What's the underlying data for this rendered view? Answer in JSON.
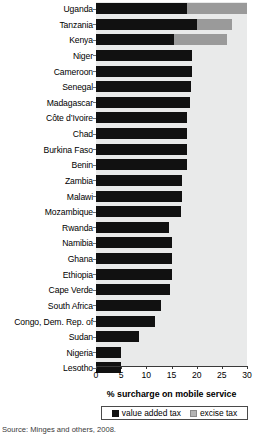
{
  "chart_data": {
    "type": "bar",
    "orientation": "horizontal",
    "title": "",
    "xlabel": "% surcharge on mobile service",
    "ylabel": "",
    "xlim": [
      0,
      30
    ],
    "xticks": [
      0,
      5,
      10,
      15,
      20,
      25,
      30
    ],
    "xticklabels": [
      "0",
      "5",
      "10",
      "15",
      "20",
      "25",
      "30"
    ],
    "grid": false,
    "legend_position": "bottom",
    "categories": [
      "Uganda",
      "Tanzania",
      "Kenya",
      "Niger",
      "Cameroon",
      "Senegal",
      "Madagascar",
      "Côte d’Ivoire",
      "Chad",
      "Burkina Faso",
      "Benin",
      "Zambia",
      "Malawi",
      "Mozambique",
      "Rwanda",
      "Namibia",
      "Ghana",
      "Ethiopia",
      "Cape Verde",
      "South Africa",
      "Congo, Dem. Rep. of",
      "Sudan",
      "Nigeria",
      "Lesotho"
    ],
    "series": [
      {
        "name": "value added tax",
        "color": "#111111",
        "values": [
          18.0,
          20.0,
          15.5,
          19.0,
          19.0,
          18.8,
          18.6,
          18.0,
          18.0,
          18.0,
          18.0,
          17.0,
          17.0,
          16.8,
          14.5,
          15.0,
          15.0,
          15.0,
          14.8,
          13.0,
          11.8,
          8.5,
          5.0,
          5.0
        ]
      },
      {
        "name": "excise tax",
        "color": "#9a9a9a",
        "values": [
          12.0,
          7.0,
          10.5,
          0,
          0,
          0,
          0,
          0,
          0,
          0,
          0,
          0,
          0,
          0,
          0,
          0,
          0,
          0,
          0,
          0,
          0,
          0,
          0,
          0
        ]
      }
    ],
    "totals": [
      30.0,
      27.0,
      26.0,
      19.0,
      19.0,
      18.8,
      18.6,
      18.0,
      18.0,
      18.0,
      18.0,
      17.0,
      17.0,
      16.8,
      14.5,
      15.0,
      15.0,
      15.0,
      14.8,
      13.0,
      11.8,
      8.5,
      5.0,
      5.0
    ]
  },
  "legend": {
    "items": [
      {
        "label": "value added tax",
        "swatch": "vat"
      },
      {
        "label": "excise tax",
        "swatch": "exc"
      }
    ]
  },
  "source_note": "Source: Minges and others, 2008."
}
